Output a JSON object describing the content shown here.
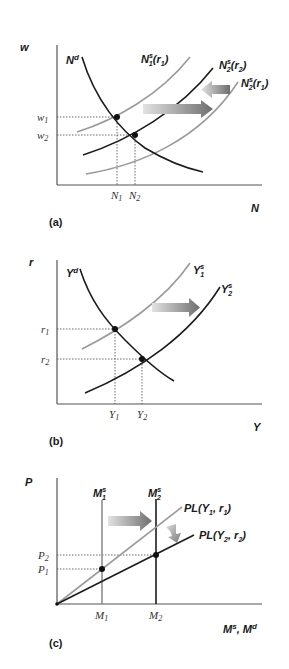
{
  "figure": {
    "colors": {
      "dark_curve": "#1c1c1c",
      "light_curve": "#9a9a9a",
      "axis": "#555555",
      "arrow_start": "#d8d8d8",
      "arrow_end": "#707070"
    },
    "panels": [
      {
        "id": "a",
        "label": "(a)",
        "y_axis_label": "w",
        "x_axis_label": "N",
        "curves": {
          "demand": {
            "label": "N",
            "sup": "d"
          },
          "supply_1": {
            "label": "N",
            "sub": "1",
            "sup": "s",
            "arg": "(r",
            "arg_sub": "1",
            "arg_end": ")"
          },
          "supply_2_r2": {
            "label": "N",
            "sub": "2",
            "sup": "s",
            "arg": "(r",
            "arg_sub": "2",
            "arg_end": ")"
          },
          "supply_2_r1": {
            "label": "N",
            "sub": "2",
            "sup": "s",
            "arg": "(r",
            "arg_sub": "1",
            "arg_end": ")"
          }
        },
        "y_ticks": [
          {
            "label": "w",
            "sub": "1"
          },
          {
            "label": "w",
            "sub": "2"
          }
        ],
        "x_ticks": [
          {
            "label": "N",
            "sub": "1"
          },
          {
            "label": "N",
            "sub": "2"
          }
        ],
        "arrows": [
          "shift-right",
          "shift-left"
        ]
      },
      {
        "id": "b",
        "label": "(b)",
        "y_axis_label": "r",
        "x_axis_label": "Y",
        "curves": {
          "demand": {
            "label": "Y",
            "sup": "d"
          },
          "supply_1": {
            "label": "Y",
            "sub": "1",
            "sup": "s"
          },
          "supply_2": {
            "label": "Y",
            "sub": "2",
            "sup": "s"
          }
        },
        "y_ticks": [
          {
            "label": "r",
            "sub": "1"
          },
          {
            "label": "r",
            "sub": "2"
          }
        ],
        "x_ticks": [
          {
            "label": "Y",
            "sub": "1"
          },
          {
            "label": "Y",
            "sub": "2"
          }
        ],
        "arrows": [
          "shift-right"
        ]
      },
      {
        "id": "c",
        "label": "(c)",
        "y_axis_label": "P",
        "x_axis_label": {
          "m1": "M",
          "s1": "s",
          "sep": ", ",
          "m2": "M",
          "s2": "d"
        },
        "curves": {
          "money_supply_1": {
            "label": "M",
            "sub": "1",
            "sup": "s"
          },
          "money_supply_2": {
            "label": "M",
            "sub": "2",
            "sup": "s"
          },
          "money_demand_1": {
            "label": "PL(Y",
            "sub": "1",
            "mid": ", r",
            "sub2": "1",
            "end": ")"
          },
          "money_demand_2": {
            "label": "PL(Y",
            "sub": "2",
            "mid": ", r",
            "sub2": "2",
            "end": ")"
          }
        },
        "y_ticks": [
          {
            "label": "P",
            "sub": "2"
          },
          {
            "label": "P",
            "sub": "1"
          }
        ],
        "x_ticks": [
          {
            "label": "M",
            "sub": "1"
          },
          {
            "label": "M",
            "sub": "2"
          }
        ],
        "arrows": [
          "shift-right",
          "rotate-down"
        ]
      }
    ]
  }
}
